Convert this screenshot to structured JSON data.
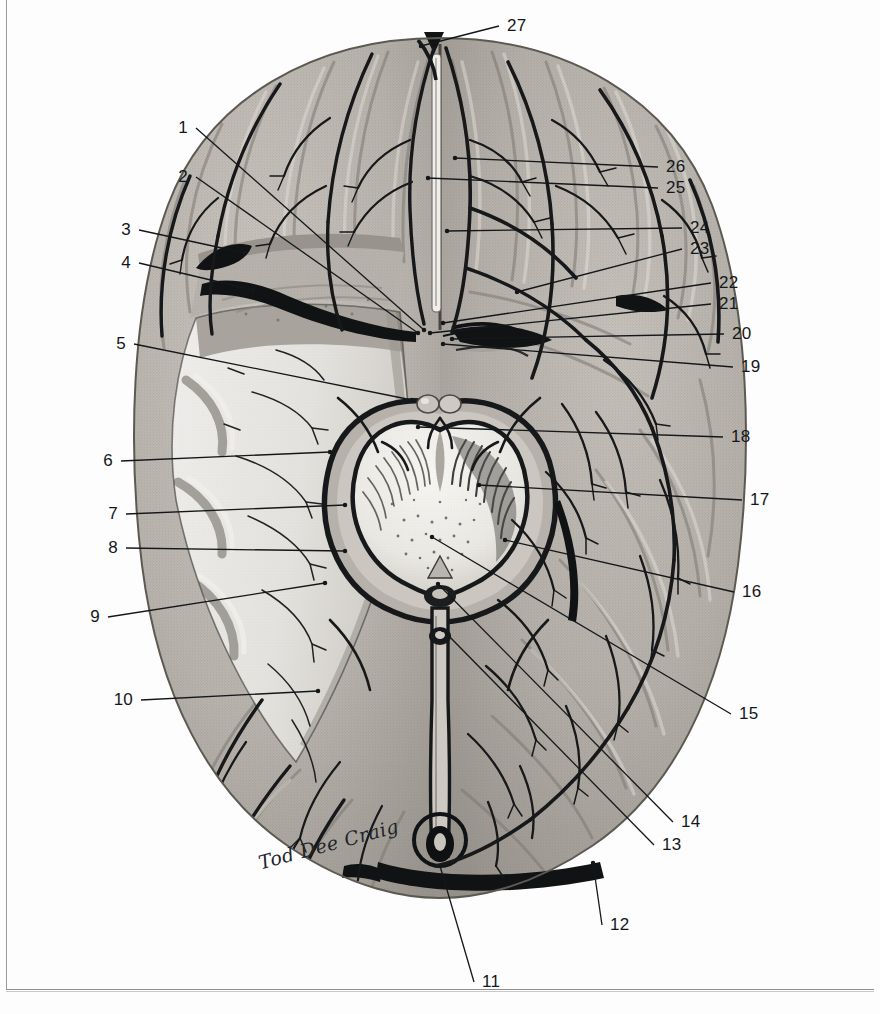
{
  "plate": {
    "title": "Superior (axial) view of the brain with midbrain cross-section",
    "signature": "Tod Dee Craig",
    "frame_color": "#9a9a9a",
    "background_color": "#fdfdfd",
    "ink_color": "#14171a"
  },
  "callouts": {
    "left": [
      {
        "num": "1",
        "x": 188,
        "y": 128,
        "tip_x": 424,
        "tip_y": 330
      },
      {
        "num": "2",
        "x": 188,
        "y": 177,
        "tip_x": 418,
        "tip_y": 333
      },
      {
        "num": "3",
        "x": 131,
        "y": 230,
        "tip_x": 245,
        "tip_y": 253
      },
      {
        "num": "4",
        "x": 131,
        "y": 263,
        "tip_x": 253,
        "tip_y": 290
      },
      {
        "num": "5",
        "x": 126,
        "y": 344,
        "tip_x": 412,
        "tip_y": 400
      },
      {
        "num": "6",
        "x": 113,
        "y": 461,
        "tip_x": 330,
        "tip_y": 452
      },
      {
        "num": "7",
        "x": 118,
        "y": 514,
        "tip_x": 345,
        "tip_y": 505
      },
      {
        "num": "8",
        "x": 118,
        "y": 548,
        "tip_x": 345,
        "tip_y": 551
      },
      {
        "num": "9",
        "x": 100,
        "y": 617,
        "tip_x": 325,
        "tip_y": 583
      },
      {
        "num": "10",
        "x": 133,
        "y": 700,
        "tip_x": 318,
        "tip_y": 691
      }
    ],
    "right": [
      {
        "num": "27",
        "x": 507,
        "y": 26,
        "tip_x": 421,
        "tip_y": 46
      },
      {
        "num": "26",
        "x": 666,
        "y": 167,
        "tip_x": 455,
        "tip_y": 158
      },
      {
        "num": "25",
        "x": 666,
        "y": 188,
        "tip_x": 428,
        "tip_y": 178
      },
      {
        "num": "24",
        "x": 690,
        "y": 228,
        "tip_x": 447,
        "tip_y": 231
      },
      {
        "num": "23",
        "x": 690,
        "y": 249,
        "tip_x": 517,
        "tip_y": 292
      },
      {
        "num": "22",
        "x": 719,
        "y": 283,
        "tip_x": 443,
        "tip_y": 323
      },
      {
        "num": "21",
        "x": 719,
        "y": 304,
        "tip_x": 430,
        "tip_y": 333
      },
      {
        "num": "20",
        "x": 732,
        "y": 334,
        "tip_x": 452,
        "tip_y": 339
      },
      {
        "num": "19",
        "x": 741,
        "y": 367,
        "tip_x": 443,
        "tip_y": 344
      },
      {
        "num": "18",
        "x": 731,
        "y": 437,
        "tip_x": 418,
        "tip_y": 427
      },
      {
        "num": "17",
        "x": 750,
        "y": 500,
        "tip_x": 479,
        "tip_y": 485
      },
      {
        "num": "16",
        "x": 742,
        "y": 592,
        "tip_x": 505,
        "tip_y": 540
      },
      {
        "num": "15",
        "x": 739,
        "y": 714,
        "tip_x": 432,
        "tip_y": 537
      },
      {
        "num": "14",
        "x": 681,
        "y": 822,
        "tip_x": 438,
        "tip_y": 584
      },
      {
        "num": "13",
        "x": 662,
        "y": 845,
        "tip_x": 443,
        "tip_y": 630
      },
      {
        "num": "12",
        "x": 610,
        "y": 925,
        "tip_x": 593,
        "tip_y": 863
      },
      {
        "num": "11",
        "x": 482,
        "y": 982,
        "tip_x": 440,
        "tip_y": 866
      }
    ]
  },
  "palette": {
    "cortex_light": "#c9c5bf",
    "cortex_mid": "#b0aca6",
    "cortex_dark": "#8d8982",
    "white_matter": "#ececea",
    "white_matter_shade": "#d7d4cf",
    "vessel": "#16181a",
    "dura_black": "#111214",
    "peduncle": "#efeeea",
    "tegmentum": "#f4f3f0",
    "sulcus": "#6e6a64"
  }
}
